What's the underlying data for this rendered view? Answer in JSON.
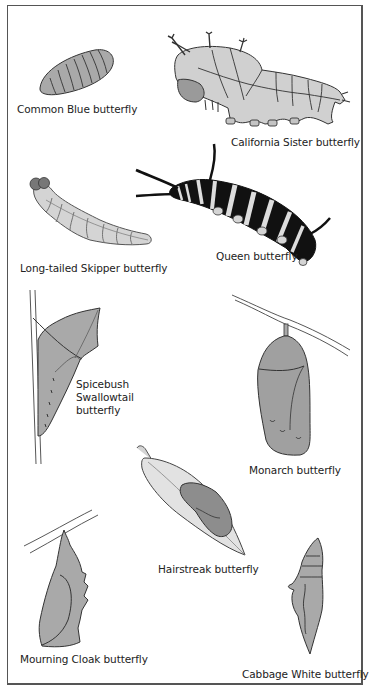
{
  "figure": {
    "colors": {
      "body_fill": "#a9a9a9",
      "light_fill": "#d6d6d6",
      "outline": "#333333",
      "dark": "#111111",
      "frame": "#555555"
    }
  },
  "specimens": [
    {
      "id": "common-blue",
      "stage": "caterpillar",
      "label": "Common Blue butterfly"
    },
    {
      "id": "california-sister",
      "stage": "caterpillar",
      "label": "California Sister butterfly"
    },
    {
      "id": "long-tailed-skipper",
      "stage": "caterpillar",
      "label": "Long-tailed Skipper butterfly"
    },
    {
      "id": "queen",
      "stage": "caterpillar",
      "label": "Queen butterfly"
    },
    {
      "id": "spicebush-swallowtail",
      "stage": "chrysalis",
      "label_lines": [
        "Spicebush",
        "Swallowtail",
        "butterfly"
      ]
    },
    {
      "id": "monarch",
      "stage": "chrysalis",
      "label": "Monarch butterfly"
    },
    {
      "id": "hairstreak",
      "stage": "chrysalis",
      "label": "Hairstreak butterfly"
    },
    {
      "id": "mourning-cloak",
      "stage": "chrysalis",
      "label": "Mourning Cloak butterfly"
    },
    {
      "id": "cabbage-white",
      "stage": "chrysalis",
      "label": "Cabbage White butterfly"
    }
  ]
}
